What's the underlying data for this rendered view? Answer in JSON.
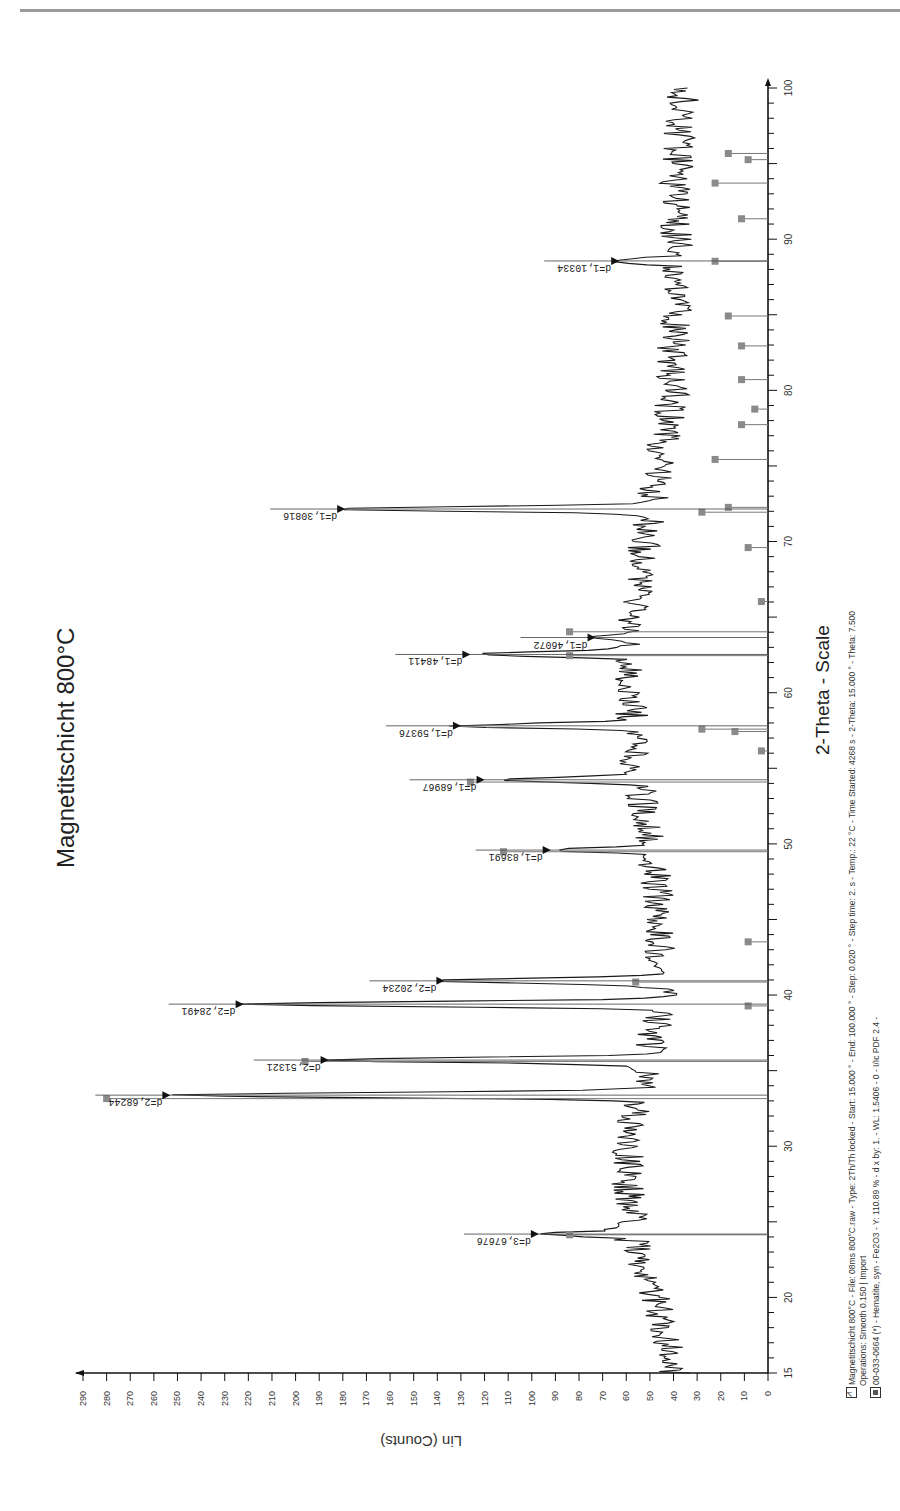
{
  "page": {
    "header_rule": true
  },
  "chart_data": {
    "type": "line",
    "orientation": "rotated-90deg",
    "title": "Magnetitschicht  800°C",
    "xlabel": "2-Theta - Scale",
    "ylabel": "Lin (Counts)",
    "xlim": [
      15,
      100
    ],
    "ylim": [
      0,
      290
    ],
    "x_ticks": [
      15,
      20,
      30,
      40,
      50,
      60,
      70,
      80,
      90,
      100
    ],
    "y_ticks": [
      0,
      10,
      20,
      30,
      40,
      50,
      60,
      70,
      80,
      90,
      100,
      110,
      120,
      130,
      140,
      150,
      160,
      170,
      180,
      190,
      200,
      210,
      220,
      230,
      240,
      250,
      260,
      270,
      280,
      290
    ],
    "grid": false,
    "background_profile": [
      [
        15,
        40
      ],
      [
        18,
        44
      ],
      [
        21,
        50
      ],
      [
        23,
        55
      ],
      [
        25,
        58
      ],
      [
        28,
        60
      ],
      [
        31,
        58
      ],
      [
        32.5,
        55
      ],
      [
        36.5,
        50
      ],
      [
        38.5,
        46
      ],
      [
        42,
        45
      ],
      [
        45,
        46
      ],
      [
        48,
        48
      ],
      [
        52,
        52
      ],
      [
        56,
        57
      ],
      [
        60,
        58
      ],
      [
        64,
        58
      ],
      [
        68,
        54
      ],
      [
        72,
        50
      ],
      [
        76,
        45
      ],
      [
        80,
        40
      ],
      [
        84,
        40
      ],
      [
        88,
        38
      ],
      [
        92,
        40
      ],
      [
        96,
        38
      ],
      [
        100,
        36
      ]
    ],
    "peaks": [
      {
        "two_theta": 24.19,
        "intensity": 97,
        "label": "d=3,67676"
      },
      {
        "two_theta": 33.38,
        "intensity": 253,
        "label": "d=2,68244"
      },
      {
        "two_theta": 35.7,
        "intensity": 186,
        "label": "d=2,51321"
      },
      {
        "two_theta": 39.4,
        "intensity": 222,
        "label": "d=2,28491"
      },
      {
        "two_theta": 40.94,
        "intensity": 137,
        "label": "d=2,20234"
      },
      {
        "two_theta": 49.59,
        "intensity": 92,
        "label": "d=1,83691"
      },
      {
        "two_theta": 54.24,
        "intensity": 120,
        "label": "d=1,68967"
      },
      {
        "two_theta": 57.81,
        "intensity": 130,
        "label": "d=1,59376"
      },
      {
        "two_theta": 62.53,
        "intensity": 126,
        "label": "d=1,48411"
      },
      {
        "two_theta": 63.65,
        "intensity": 73,
        "label": "d=1,46072"
      },
      {
        "two_theta": 72.15,
        "intensity": 179,
        "label": "d=1,30816"
      },
      {
        "two_theta": 88.56,
        "intensity": 63,
        "label": "d=1,10334"
      }
    ],
    "reference_pattern": {
      "name": "00-033-0664 (*) - Hematite, syn - Fe2O3",
      "sticks": [
        [
          24.14,
          30
        ],
        [
          33.15,
          100
        ],
        [
          35.61,
          70
        ],
        [
          39.28,
          3
        ],
        [
          40.86,
          20
        ],
        [
          43.52,
          3
        ],
        [
          49.48,
          40
        ],
        [
          54.09,
          45
        ],
        [
          56.15,
          1
        ],
        [
          57.43,
          5
        ],
        [
          57.59,
          10
        ],
        [
          62.45,
          30
        ],
        [
          64.03,
          30
        ],
        [
          66.03,
          1
        ],
        [
          69.6,
          3
        ],
        [
          71.94,
          10
        ],
        [
          72.26,
          6
        ],
        [
          75.43,
          8
        ],
        [
          77.73,
          4
        ],
        [
          78.76,
          2
        ],
        [
          80.71,
          4
        ],
        [
          82.94,
          4
        ],
        [
          84.92,
          6
        ],
        [
          88.54,
          8
        ],
        [
          91.35,
          4
        ],
        [
          93.71,
          8
        ],
        [
          95.26,
          3
        ],
        [
          95.67,
          6
        ]
      ],
      "scale_counts_per_pct": 0.28
    },
    "legend": [
      {
        "marker": "pattern-icon",
        "text": "Magnetitschicht  800°C - File: 08ms 800°C.raw - Type: 2Th/Th locked - Start: 15.000 ° - End: 100.000 ° - Step: 0.020 ° - Step time: 2. s - Temp.: 22 °C - Time Started: 4268 s - 2-Theta: 15.000 ° - Theta: 7.500"
      },
      {
        "marker": "none",
        "text": "Operations: Smooth 0.150 | Import"
      },
      {
        "marker": "reference-icon",
        "text": "00-033-0664 (*) - Hematite, syn - Fe2O3 - Y: 110.89 % - d x by: 1. - WL: 1.5406 - 0 - I/Ic PDF 2.4 -"
      }
    ],
    "colors": {
      "pattern": "#1a1a1a",
      "reference": "#777777",
      "axis": "#111111"
    }
  }
}
